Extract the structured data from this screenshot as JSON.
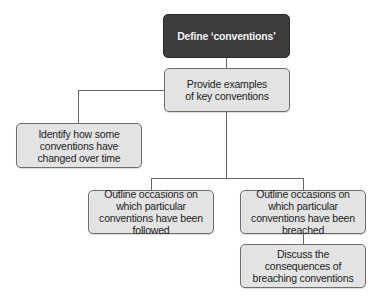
{
  "diagram": {
    "type": "flowchart",
    "nodes": {
      "define": "Define ‘conventions’",
      "examples": "Provide examples of key conventions",
      "changed": "Identify how some conventions have changed over time",
      "followed": "Outline occasions on which particular conventions have been followed",
      "breached": "Outline occasions on which particular conventions have been breached",
      "consequences": "Discuss the consequences of breaching conventions"
    },
    "edges": [
      [
        "define",
        "examples"
      ],
      [
        "examples",
        "changed"
      ],
      [
        "examples",
        "followed"
      ],
      [
        "examples",
        "breached"
      ],
      [
        "breached",
        "consequences"
      ]
    ],
    "colors": {
      "root_fill": "#3c3c3c",
      "node_fill": "#e3e3e3",
      "border": "#6e6e6e",
      "connector": "#666666"
    }
  }
}
